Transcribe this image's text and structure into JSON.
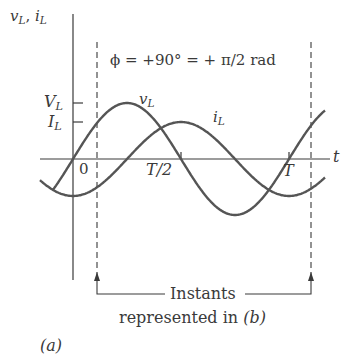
{
  "figure": {
    "panel_label": "(a)",
    "axis_y_label_v": "v",
    "axis_y_label_sep": ", ",
    "axis_y_label_i": "i",
    "subscript": "L",
    "axis_x_label": "t",
    "phase_annotation": "ϕ = +90° = + π/2 rad",
    "tick_VL": "V",
    "tick_IL": "I",
    "tick_zero": "0",
    "tick_half_period": "T/2",
    "tick_period": "T",
    "curve_voltage_label": "v",
    "curve_current_label": "i",
    "caption_line1": "Instants",
    "caption_line2_prefix": "represented in ",
    "caption_line2_ref": "(b)"
  },
  "colors": {
    "curve": "#555555",
    "axis": "#3a3a3a",
    "background": "#ffffff"
  }
}
